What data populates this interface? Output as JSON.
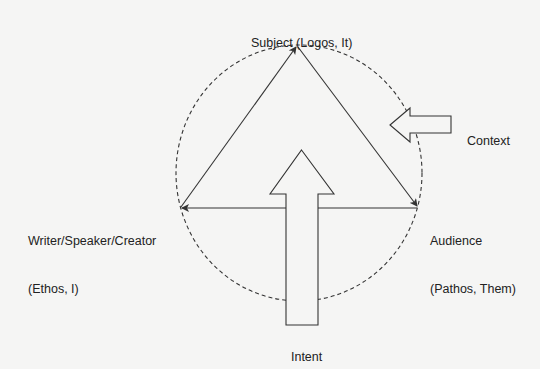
{
  "diagram": {
    "nodes": {
      "subject": {
        "line1": "Subject (Logos, It)"
      },
      "writer": {
        "line1": "Writer/Speaker/Creator",
        "line2": "(Ethos, I)"
      },
      "audience": {
        "line1": "Audience",
        "line2": "(Pathos, Them)"
      }
    },
    "context": {
      "label": "Context"
    },
    "intent": {
      "label": "Intent"
    },
    "colors": {
      "background": "#f5f5f4",
      "stroke": "#333333",
      "text": "#222222"
    }
  }
}
